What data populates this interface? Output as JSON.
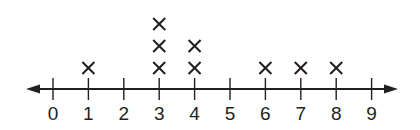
{
  "chart_data": {
    "type": "scatter",
    "subtype": "line-plot (dot plot with X marks)",
    "title": "",
    "xlabel": "",
    "ylabel": "",
    "x_ticks": [
      0,
      1,
      2,
      3,
      4,
      5,
      6,
      7,
      8,
      9
    ],
    "xlim": [
      0,
      9
    ],
    "marker": "X",
    "counts": [
      {
        "x": 0,
        "count": 0
      },
      {
        "x": 1,
        "count": 1
      },
      {
        "x": 2,
        "count": 0
      },
      {
        "x": 3,
        "count": 3
      },
      {
        "x": 4,
        "count": 2
      },
      {
        "x": 5,
        "count": 0
      },
      {
        "x": 6,
        "count": 1
      },
      {
        "x": 7,
        "count": 1
      },
      {
        "x": 8,
        "count": 1
      },
      {
        "x": 9,
        "count": 0
      }
    ],
    "values": [
      1,
      3,
      3,
      3,
      4,
      4,
      6,
      7,
      8
    ],
    "grid": false,
    "legend": null,
    "axis_arrows": "both ends"
  },
  "style": {
    "ink_color": "#231f20",
    "background": "#ffffff"
  }
}
